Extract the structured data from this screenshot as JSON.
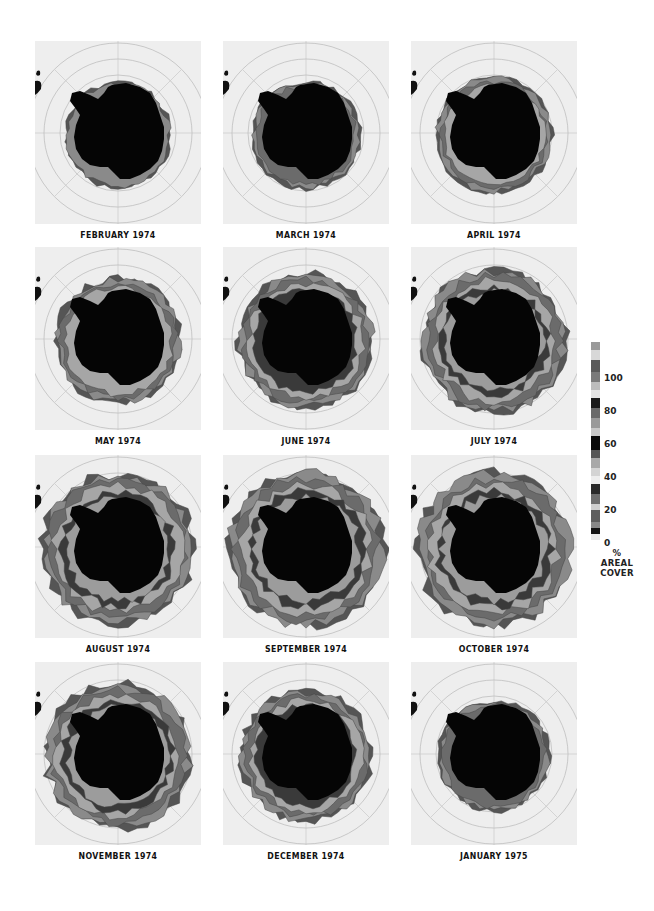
{
  "figure": {
    "panels": [
      {
        "label": "FEBRUARY 1974",
        "row": 0,
        "col": 0,
        "ice_extent": 0.08
      },
      {
        "label": "MARCH 1974",
        "row": 0,
        "col": 1,
        "ice_extent": 0.12
      },
      {
        "label": "APRIL 1974",
        "row": 0,
        "col": 2,
        "ice_extent": 0.28
      },
      {
        "label": "MAY 1974",
        "row": 1,
        "col": 0,
        "ice_extent": 0.45
      },
      {
        "label": "JUNE 1974",
        "row": 1,
        "col": 1,
        "ice_extent": 0.62
      },
      {
        "label": "JULY 1974",
        "row": 1,
        "col": 2,
        "ice_extent": 0.78
      },
      {
        "label": "AUGUST 1974",
        "row": 2,
        "col": 0,
        "ice_extent": 0.92
      },
      {
        "label": "SEPTEMBER 1974",
        "row": 2,
        "col": 1,
        "ice_extent": 1.0
      },
      {
        "label": "OCTOBER 1974",
        "row": 2,
        "col": 2,
        "ice_extent": 0.96
      },
      {
        "label": "NOVEMBER 1974",
        "row": 3,
        "col": 0,
        "ice_extent": 0.82
      },
      {
        "label": "DECEMBER 1974",
        "row": 3,
        "col": 1,
        "ice_extent": 0.55
      },
      {
        "label": "JANUARY 1975",
        "row": 3,
        "col": 2,
        "ice_extent": 0.18
      }
    ]
  },
  "legend": {
    "ticks": [
      "100",
      "80",
      "60",
      "40",
      "20",
      "0"
    ],
    "unit": "%",
    "caption_line1": "AREAL",
    "caption_line2": "COVER"
  },
  "chart_data": {
    "type": "heatmap",
    "panels": [
      "FEBRUARY 1974",
      "MARCH 1974",
      "APRIL 1974",
      "MAY 1974",
      "JUNE 1974",
      "JULY 1974",
      "AUGUST 1974",
      "SEPTEMBER 1974",
      "OCTOBER 1974",
      "NOVEMBER 1974",
      "DECEMBER 1974",
      "JANUARY 1975"
    ],
    "grid": {
      "rows": 4,
      "cols": 3
    },
    "colorbar": {
      "label": "% AREAL COVER",
      "range": [
        0,
        100
      ],
      "ticks": [
        0,
        20,
        40,
        60,
        80,
        100
      ],
      "colormap": "grayscale banded"
    },
    "projection": "south polar stereographic with latitude circles and meridians",
    "relative_ice_extent": [
      0.08,
      0.12,
      0.28,
      0.45,
      0.62,
      0.78,
      0.92,
      1.0,
      0.96,
      0.82,
      0.55,
      0.18
    ]
  }
}
